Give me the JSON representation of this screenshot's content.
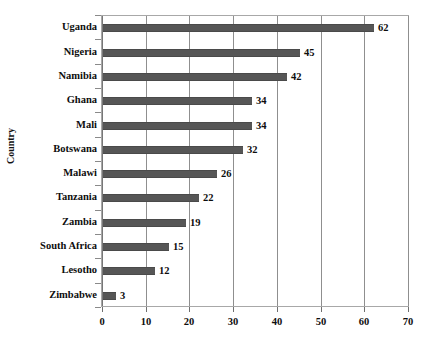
{
  "chart_data": {
    "type": "bar",
    "orientation": "horizontal",
    "title": "",
    "xlabel": "",
    "ylabel": "Country",
    "categories": [
      "Uganda",
      "Nigeria",
      "Namibia",
      "Ghana",
      "Mali",
      "Botswana",
      "Malawi",
      "Tanzania",
      "Zambia",
      "South Africa",
      "Lesotho",
      "Zimbabwe"
    ],
    "values": [
      62,
      45,
      42,
      34,
      34,
      32,
      26,
      22,
      19,
      15,
      12,
      3
    ],
    "data_labels": [
      "62",
      "45",
      "42",
      "34",
      "34",
      "32",
      "26",
      "22",
      "19",
      "15",
      "12",
      "3"
    ],
    "xlim": [
      0,
      70
    ],
    "xticks": [
      0,
      10,
      20,
      30,
      40,
      50,
      60,
      70
    ],
    "xtick_labels": [
      "0",
      "10",
      "20",
      "30",
      "40",
      "50",
      "60",
      "70"
    ],
    "grid": "vertical",
    "legend": "none",
    "bar_color": "#565656",
    "gridline_color": "#8f8f8f",
    "frame_color": "#a8a8a8",
    "text_color": "#0d0d0d"
  }
}
